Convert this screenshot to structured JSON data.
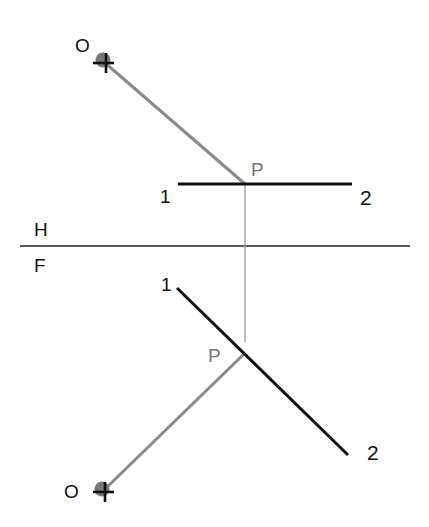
{
  "diagram": {
    "type": "descriptive-geometry-projection",
    "fold_line": {
      "label_top": "H",
      "label_bottom": "F",
      "y": 246,
      "x1": 20,
      "x2": 410
    },
    "top_view": {
      "observer": {
        "label": "O",
        "x": 104,
        "y": 62
      },
      "line": {
        "start_label": "1",
        "end_label": "2",
        "x1": 178,
        "y1": 184,
        "x2": 352,
        "y2": 184
      },
      "point": {
        "label": "P",
        "x": 245,
        "y": 184
      }
    },
    "front_view": {
      "observer": {
        "label": "O",
        "x": 104,
        "y": 490
      },
      "line": {
        "start_label": "1",
        "end_label": "2",
        "x1": 177,
        "y1": 288,
        "x2": 348,
        "y2": 455
      },
      "point": {
        "label": "P",
        "x": 245,
        "y": 353
      }
    },
    "projector": {
      "x": 245,
      "y1": 184,
      "y2": 342
    },
    "colors": {
      "line": "#111111",
      "sight_line": "#8a8a8a",
      "projector": "#999999",
      "observer_dot": "#777777"
    }
  }
}
